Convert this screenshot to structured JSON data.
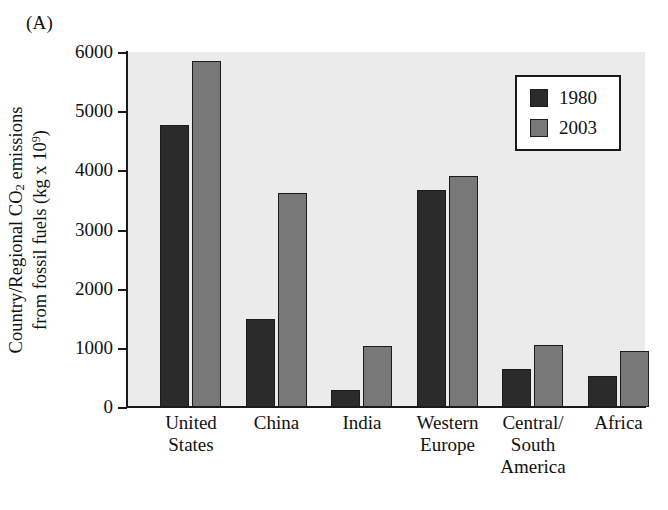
{
  "panel": {
    "label": "(A)"
  },
  "chart_data": {
    "type": "bar",
    "title": "",
    "panel_label": "(A)",
    "xlabel": "",
    "ylabel_line1": "Country/Regional CO2 emissions",
    "ylabel_line2": "from fossil fuels (kg x 10^9)",
    "ylabel_parts": {
      "pre_sub": "Country/Regional CO",
      "sub": "2",
      "post_sub": " emissions",
      "line2_pre_sup": "from fossil fuels (kg x 10",
      "sup": "9",
      "line2_post_sup": ")"
    },
    "categories": [
      "United States",
      "China",
      "India",
      "Western Europe",
      "Central/ South America",
      "Africa"
    ],
    "category_lines": [
      [
        "United",
        "States"
      ],
      [
        "China"
      ],
      [
        "India"
      ],
      [
        "Western",
        "Europe"
      ],
      [
        "Central/",
        "South",
        "America"
      ],
      [
        "Africa"
      ]
    ],
    "series": [
      {
        "name": "1980",
        "color": "#2b2b2b",
        "values": [
          4760,
          1490,
          290,
          3660,
          640,
          520
        ]
      },
      {
        "name": "2003",
        "color": "#787878",
        "values": [
          5850,
          3610,
          1030,
          3900,
          1040,
          950
        ]
      }
    ],
    "ylim": [
      0,
      6000
    ],
    "yticks": [
      0,
      1000,
      2000,
      3000,
      4000,
      5000,
      6000
    ],
    "ytick_labels": [
      "0",
      "1000",
      "2000",
      "3000",
      "4000",
      "5000",
      "6000"
    ],
    "grid": false,
    "legend_position": "top-right",
    "plot_background": "#ebebeb",
    "figure_background": "#ffffff",
    "axis_color": "#1a1a1a"
  },
  "legend": {
    "entries": [
      {
        "label": "1980",
        "color": "#2b2b2b"
      },
      {
        "label": "2003",
        "color": "#787878"
      }
    ]
  }
}
